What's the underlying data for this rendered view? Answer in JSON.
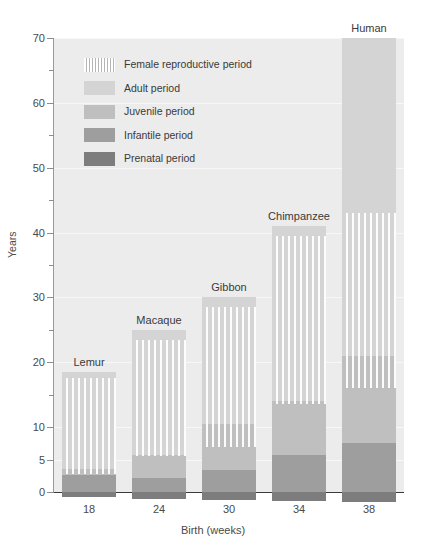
{
  "chart_data": {
    "type": "bar",
    "title": "",
    "subtitle": "",
    "xlabel": "Birth (weeks)",
    "ylabel": "Years",
    "ylim": [
      0,
      70
    ],
    "ytick_labels": [
      "0",
      "5",
      "10",
      "20",
      "30",
      "40",
      "50",
      "60",
      "70"
    ],
    "ytick_values": [
      0,
      5,
      10,
      20,
      30,
      40,
      50,
      60,
      70
    ],
    "yminor_values": [
      15,
      25,
      35,
      45,
      55,
      65
    ],
    "grid": true,
    "grid_axis": "y",
    "stacked": true,
    "legend_position": "upper-left-inside",
    "categories": [
      "Lemur",
      "Macaque",
      "Gibbon",
      "Chimpanzee",
      "Human"
    ],
    "xtick_labels": [
      "18",
      "24",
      "30",
      "34",
      "38"
    ],
    "xtick_values": [
      18,
      24,
      30,
      34,
      38
    ],
    "series": [
      {
        "name": "Prenatal period",
        "color": "#7d7d7d",
        "values": [
          0.35,
          0.46,
          0.58,
          0.65,
          0.73
        ],
        "note": "gestation in years, drawn below the zero line"
      },
      {
        "name": "Infantile period",
        "color": "#9e9e9e",
        "values": [
          2.6,
          2.2,
          3.4,
          5.7,
          7.5
        ]
      },
      {
        "name": "Juvenile period",
        "color": "#bfbfbf",
        "values": [
          0.9,
          3.5,
          7.1,
          8.3,
          13.5
        ]
      },
      {
        "name": "Adult period",
        "color": "#d4d4d4",
        "values": [
          15.0,
          19.3,
          19.5,
          27.0,
          49.0
        ]
      }
    ],
    "totals": [
      18.5,
      25.0,
      30.0,
      41.0,
      70.0
    ],
    "female_reproductive_period": {
      "name": "Female reproductive period",
      "hatch": "vertical-lines",
      "start_years": [
        2.8,
        5.5,
        7.0,
        13.5,
        16.0
      ],
      "end_years": [
        17.5,
        23.5,
        28.5,
        39.5,
        43.0
      ]
    }
  },
  "legend": {
    "items": [
      {
        "label": "Female reproductive period",
        "swatch": "hatch-swatch",
        "icon": "hatch-pattern-icon"
      },
      {
        "label": "Adult period",
        "swatch": "adult",
        "icon": "adult-swatch-icon"
      },
      {
        "label": "Juvenile period",
        "swatch": "juvenile",
        "icon": "juvenile-swatch-icon"
      },
      {
        "label": "Infantile period",
        "swatch": "infantile",
        "icon": "infantile-swatch-icon"
      },
      {
        "label": "Prenatal period",
        "swatch": "prenatal",
        "icon": "prenatal-swatch-icon"
      }
    ]
  },
  "axes": {
    "y_title": "Years",
    "x_title": "Birth (weeks)",
    "y_labels": [
      "70",
      "60",
      "50",
      "40",
      "30",
      "20",
      "10",
      "5",
      "0"
    ],
    "x_labels": [
      "18",
      "24",
      "30",
      "34",
      "38"
    ]
  },
  "bar_labels": [
    "Lemur",
    "Macaque",
    "Gibbon",
    "Chimpanzee",
    "Human"
  ],
  "colors": {
    "adult": "#d4d4d4",
    "juvenile": "#bfbfbf",
    "infantile": "#9e9e9e",
    "prenatal": "#7d7d7d",
    "plot_background": "#ececec",
    "gridline": "#f7f7f7",
    "axis": "#3a3a3a"
  }
}
